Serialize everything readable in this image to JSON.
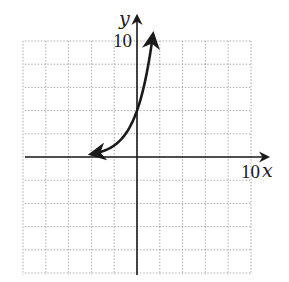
{
  "chart_data": {
    "type": "line",
    "title": "",
    "xlabel": "x",
    "ylabel": "y",
    "xlim": [
      -10,
      10
    ],
    "ylim": [
      -10,
      10
    ],
    "grid": true,
    "grid_step": 2,
    "grid_style": "dotted",
    "tick_labels": {
      "x": "10",
      "y": "10"
    },
    "series": [
      {
        "name": "exponential curve",
        "function": "y = 4 * 2^x",
        "arrows": "both ends",
        "x": [
          -4,
          -3,
          -2,
          -1,
          0,
          0.5,
          1,
          1.4
        ],
        "y": [
          0.25,
          0.5,
          1,
          2,
          4,
          5.7,
          8,
          10.6
        ]
      }
    ],
    "legend": null
  },
  "labels": {
    "x_axis": "x",
    "y_axis": "y",
    "x_tick": "10",
    "y_tick": "10"
  },
  "colors": {
    "axis": "#1a1a1a",
    "curve": "#1a1a1a",
    "grid": "#9a9a9a",
    "background": "#ffffff"
  }
}
